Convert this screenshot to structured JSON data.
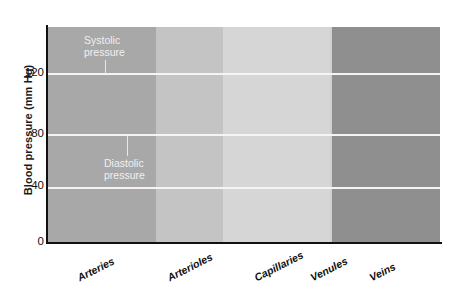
{
  "chart_data": {
    "type": "line",
    "title": "",
    "xlabel": "",
    "ylabel": "Blood pressure (mm Hg)",
    "ylim": [
      0,
      140
    ],
    "yticks": [
      0,
      40,
      80,
      120
    ],
    "ytick_labels": [
      "0",
      "40",
      "80",
      "120"
    ],
    "grid": true,
    "grid_values": [
      40,
      80,
      120
    ],
    "legend": "none",
    "categories": [
      "Arteries",
      "Arterioles",
      "Capillaries",
      "Venules",
      "Veins"
    ],
    "band_colors": [
      "#a8a8a8",
      "#c4c4c4",
      "#d6d6d6",
      "#d0d0d0",
      "#8f8f8f"
    ],
    "band_fractions": [
      0.275,
      0.172,
      0.273,
      0.005,
      0.275
    ],
    "annotations": [
      {
        "text_line1": "Systolic",
        "text_line2": "pressure",
        "points_to_value": 120
      },
      {
        "text_line1": "Diastolic",
        "text_line2": "pressure",
        "points_to_value": 80
      }
    ],
    "series": [
      {
        "name": "Blood pressure",
        "color": "#2a2a2a",
        "description": "Pulsatile 120/80 mm Hg in arteries, damping through arterioles, falling to near 0-5 mm Hg in veins",
        "systolic_arteries": 120,
        "diastolic_arteries": 80,
        "mean_arterioles_start": 95,
        "mean_capillaries": 35,
        "mean_venules": 15,
        "mean_veins": 5,
        "end_value": 3,
        "pulse_count_arteries": 7,
        "x": [
          0.0,
          0.012,
          0.025,
          0.037,
          0.05,
          0.062,
          0.075,
          0.087,
          0.1,
          0.112,
          0.125,
          0.137,
          0.15,
          0.162,
          0.175,
          0.187,
          0.2,
          0.212,
          0.225,
          0.237,
          0.25,
          0.262,
          0.275,
          0.29,
          0.305,
          0.32,
          0.335,
          0.35,
          0.365,
          0.38,
          0.395,
          0.41,
          0.425,
          0.44,
          0.455,
          0.47,
          0.5,
          0.55,
          0.6,
          0.65,
          0.7,
          0.75,
          0.8,
          0.85,
          0.9,
          0.95,
          1.0
        ],
        "y": [
          80,
          120,
          80,
          120,
          80,
          120,
          80,
          120,
          80,
          120,
          80,
          120,
          80,
          120,
          80,
          118,
          82,
          112,
          80,
          104,
          74,
          96,
          70,
          88,
          64,
          80,
          58,
          72,
          52,
          64,
          48,
          58,
          45,
          52,
          43,
          46,
          41,
          36,
          31,
          26,
          22,
          18,
          15,
          12,
          9,
          6,
          4
        ]
      }
    ]
  }
}
